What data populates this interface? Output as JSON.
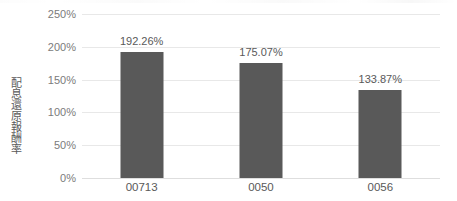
{
  "chart_data": {
    "type": "bar",
    "title": "",
    "subtitle": "",
    "xlabel": "",
    "ylabel": "配息還原報酬率",
    "categories": [
      "00713",
      "0050",
      "0056"
    ],
    "values": [
      192.26,
      175.07,
      133.87
    ],
    "value_labels": [
      "192.26%",
      "175.07%",
      "133.87%"
    ],
    "series": [
      {
        "name": "配息還原報酬率",
        "values": [
          192.26,
          175.07,
          133.87
        ],
        "color": "#595959"
      }
    ],
    "ylim": [
      0,
      250
    ],
    "y_ticks": [
      0,
      50,
      100,
      150,
      200,
      250
    ],
    "y_tick_labels": [
      "0%",
      "50%",
      "100%",
      "150%",
      "200%",
      "250%"
    ],
    "grid": true,
    "grid_axis": "y",
    "legend": false,
    "legend_position": "none",
    "value_label_position": "outside-end",
    "units": "percent"
  },
  "style": {
    "bar_color": "#595959",
    "grid_color": "#e8e8e8",
    "baseline_color": "#dedede",
    "tick_label_color": "#7b7b7b",
    "axis_title_color": "#595959",
    "data_label_color": "#595959",
    "background": "#ffffff"
  }
}
